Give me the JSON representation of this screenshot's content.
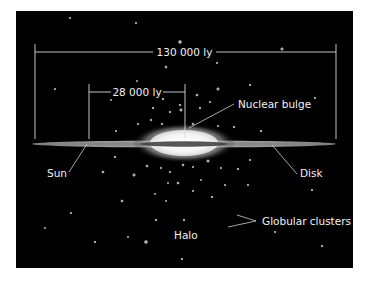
{
  "diagram": {
    "colors": {
      "background": "#000000",
      "page": "#ffffff",
      "lines": "#d8d8d8",
      "text": "#f2f2f2"
    },
    "dimensions": {
      "galaxy_diameter": "130 000 ly",
      "sun_to_center": "28 000 ly"
    },
    "labels": {
      "nuclear_bulge": "Nuclear bulge",
      "sun": "Sun",
      "disk": "Disk",
      "globular_clusters": "Globular clusters",
      "halo": "Halo"
    }
  }
}
